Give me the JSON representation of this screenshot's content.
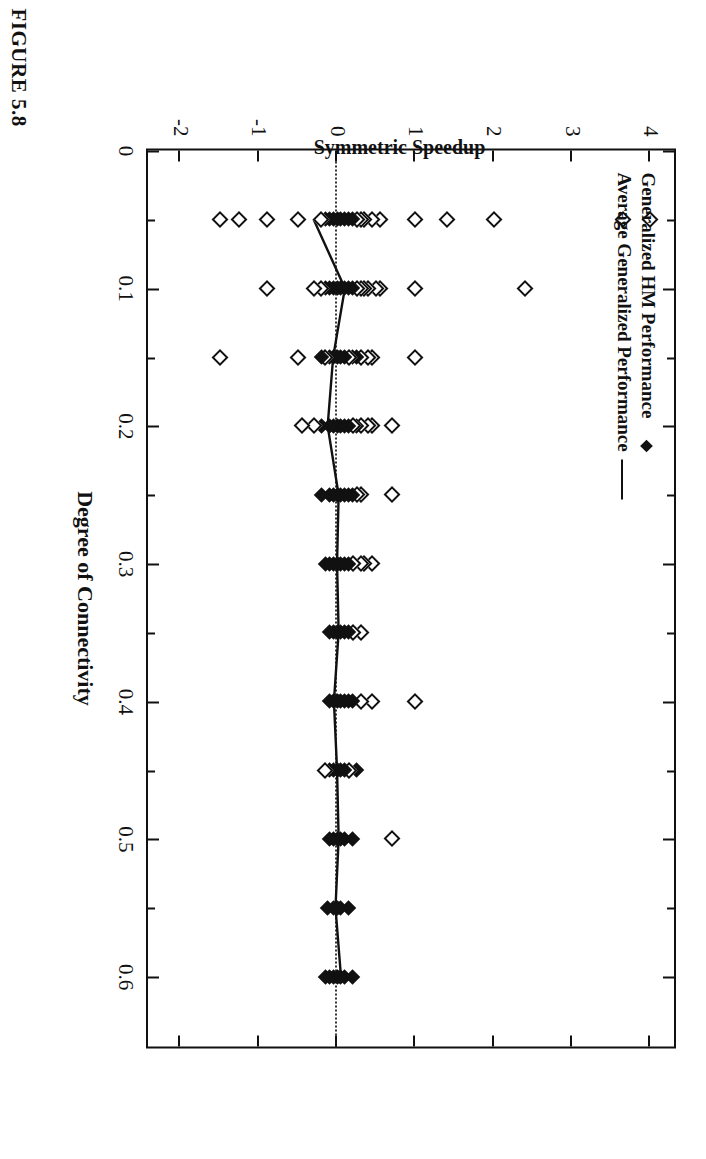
{
  "figure": {
    "caption": "FIGURE 5.8"
  },
  "chart_data": {
    "type": "scatter",
    "title": "",
    "xlabel": "Degree of Connectivity",
    "ylabel": "Symmetric Speedup",
    "xlim": [
      0,
      0.65
    ],
    "ylim": [
      -2.4,
      4.3
    ],
    "xticks": [
      0,
      0.1,
      0.2,
      0.3,
      0.4,
      0.5,
      0.6
    ],
    "xticklabels": [
      "0",
      "0.1",
      "0.2",
      "0.3",
      "0.4",
      "0.5",
      "0.6"
    ],
    "xminorticks": [
      0.05,
      0.15,
      0.25,
      0.35,
      0.45,
      0.55
    ],
    "yticks": [
      4,
      3,
      2,
      1,
      0,
      -1,
      -2
    ],
    "yticklabels": [
      "4",
      "3",
      "2",
      "1",
      "0",
      "-1",
      "-2"
    ],
    "grid": false,
    "zero_reference_line": {
      "value": 0,
      "style": "dotted"
    },
    "legend": {
      "position": "top-left",
      "entries": [
        {
          "label": "Generalized HM Performance",
          "marker": "diamond"
        },
        {
          "label": "Average Generalized Performance",
          "marker": "line"
        }
      ]
    },
    "series": [
      {
        "name": "Generalized HM Performance",
        "marker": "diamond",
        "points": [
          [
            0.05,
            4.0
          ],
          [
            0.05,
            3.65
          ],
          [
            0.05,
            2.0
          ],
          [
            0.05,
            1.4
          ],
          [
            0.05,
            1.0
          ],
          [
            0.05,
            0.55
          ],
          [
            0.05,
            0.45
          ],
          [
            0.05,
            0.35
          ],
          [
            0.05,
            0.3
          ],
          [
            0.05,
            0.25
          ],
          [
            0.05,
            0.2
          ],
          [
            0.05,
            0.15
          ],
          [
            0.05,
            0.1
          ],
          [
            0.05,
            0.05
          ],
          [
            0.05,
            0.0
          ],
          [
            0.05,
            -0.05
          ],
          [
            0.05,
            -0.1
          ],
          [
            0.05,
            -0.15
          ],
          [
            0.05,
            -0.2
          ],
          [
            0.05,
            -0.5
          ],
          [
            0.05,
            -0.9
          ],
          [
            0.05,
            -1.25
          ],
          [
            0.05,
            -1.5
          ],
          [
            0.1,
            2.4
          ],
          [
            0.1,
            1.0
          ],
          [
            0.1,
            0.55
          ],
          [
            0.1,
            0.5
          ],
          [
            0.1,
            0.4
          ],
          [
            0.1,
            0.35
          ],
          [
            0.1,
            0.3
          ],
          [
            0.1,
            0.25
          ],
          [
            0.1,
            0.2
          ],
          [
            0.1,
            0.15
          ],
          [
            0.1,
            0.1
          ],
          [
            0.1,
            0.05
          ],
          [
            0.1,
            0.0
          ],
          [
            0.1,
            -0.05
          ],
          [
            0.1,
            -0.1
          ],
          [
            0.1,
            -0.15
          ],
          [
            0.1,
            -0.2
          ],
          [
            0.1,
            -0.3
          ],
          [
            0.1,
            -0.9
          ],
          [
            0.15,
            1.0
          ],
          [
            0.15,
            0.45
          ],
          [
            0.15,
            0.4
          ],
          [
            0.15,
            0.3
          ],
          [
            0.15,
            0.25
          ],
          [
            0.15,
            0.2
          ],
          [
            0.15,
            0.15
          ],
          [
            0.15,
            0.1
          ],
          [
            0.15,
            0.05
          ],
          [
            0.15,
            0.0
          ],
          [
            0.15,
            -0.05
          ],
          [
            0.15,
            -0.1
          ],
          [
            0.15,
            -0.15
          ],
          [
            0.15,
            -0.2
          ],
          [
            0.15,
            -0.5
          ],
          [
            0.15,
            -1.5
          ],
          [
            0.2,
            0.7
          ],
          [
            0.2,
            0.45
          ],
          [
            0.2,
            0.4
          ],
          [
            0.2,
            0.3
          ],
          [
            0.2,
            0.25
          ],
          [
            0.2,
            0.2
          ],
          [
            0.2,
            0.15
          ],
          [
            0.2,
            0.1
          ],
          [
            0.2,
            0.05
          ],
          [
            0.2,
            0.0
          ],
          [
            0.2,
            -0.05
          ],
          [
            0.2,
            -0.1
          ],
          [
            0.2,
            -0.2
          ],
          [
            0.2,
            -0.3
          ],
          [
            0.2,
            -0.45
          ],
          [
            0.25,
            0.7
          ],
          [
            0.25,
            0.3
          ],
          [
            0.25,
            0.25
          ],
          [
            0.25,
            0.2
          ],
          [
            0.25,
            0.15
          ],
          [
            0.25,
            0.1
          ],
          [
            0.25,
            0.05
          ],
          [
            0.25,
            0.0
          ],
          [
            0.25,
            -0.05
          ],
          [
            0.25,
            -0.1
          ],
          [
            0.25,
            -0.2
          ],
          [
            0.3,
            0.45
          ],
          [
            0.3,
            0.35
          ],
          [
            0.3,
            0.3
          ],
          [
            0.3,
            0.2
          ],
          [
            0.3,
            0.15
          ],
          [
            0.3,
            0.1
          ],
          [
            0.3,
            0.05
          ],
          [
            0.3,
            0.0
          ],
          [
            0.3,
            -0.05
          ],
          [
            0.3,
            -0.1
          ],
          [
            0.3,
            -0.15
          ],
          [
            0.35,
            0.3
          ],
          [
            0.35,
            0.2
          ],
          [
            0.35,
            0.15
          ],
          [
            0.35,
            0.1
          ],
          [
            0.35,
            0.05
          ],
          [
            0.35,
            0.0
          ],
          [
            0.35,
            -0.05
          ],
          [
            0.35,
            -0.1
          ],
          [
            0.4,
            1.0
          ],
          [
            0.4,
            0.45
          ],
          [
            0.4,
            0.3
          ],
          [
            0.4,
            0.2
          ],
          [
            0.4,
            0.15
          ],
          [
            0.4,
            0.1
          ],
          [
            0.4,
            0.05
          ],
          [
            0.4,
            0.0
          ],
          [
            0.4,
            -0.05
          ],
          [
            0.4,
            -0.1
          ],
          [
            0.45,
            0.25
          ],
          [
            0.45,
            0.15
          ],
          [
            0.45,
            0.1
          ],
          [
            0.45,
            0.05
          ],
          [
            0.45,
            0.0
          ],
          [
            0.45,
            -0.05
          ],
          [
            0.45,
            -0.1
          ],
          [
            0.45,
            -0.15
          ],
          [
            0.5,
            0.7
          ],
          [
            0.5,
            0.2
          ],
          [
            0.5,
            0.1
          ],
          [
            0.5,
            0.05
          ],
          [
            0.5,
            0.0
          ],
          [
            0.5,
            -0.05
          ],
          [
            0.5,
            -0.1
          ],
          [
            0.55,
            0.15
          ],
          [
            0.55,
            0.05
          ],
          [
            0.55,
            0.0
          ],
          [
            0.55,
            -0.05
          ],
          [
            0.55,
            -0.12
          ],
          [
            0.6,
            0.2
          ],
          [
            0.6,
            0.1
          ],
          [
            0.6,
            0.05
          ],
          [
            0.6,
            0.0
          ],
          [
            0.6,
            -0.05
          ],
          [
            0.6,
            -0.1
          ],
          [
            0.6,
            -0.15
          ]
        ]
      },
      {
        "name": "Average Generalized Performance",
        "marker": "line",
        "points": [
          [
            0.05,
            -0.3
          ],
          [
            0.1,
            0.1
          ],
          [
            0.15,
            -0.05
          ],
          [
            0.2,
            -0.12
          ],
          [
            0.25,
            0.02
          ],
          [
            0.3,
            0.0
          ],
          [
            0.35,
            0.02
          ],
          [
            0.4,
            -0.04
          ],
          [
            0.45,
            0.0
          ],
          [
            0.5,
            0.02
          ],
          [
            0.55,
            -0.02
          ],
          [
            0.6,
            0.05
          ]
        ]
      }
    ]
  }
}
